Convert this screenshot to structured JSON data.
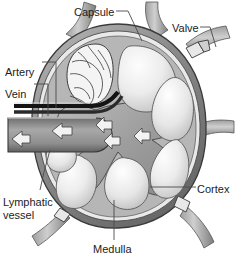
{
  "figure": {
    "style": "grayscale medical illustration",
    "background_color": "#ffffff",
    "palette": {
      "capsule": "#8d8d8d",
      "capsule_dark": "#6a6a6a",
      "cortex_light": "#efefef",
      "cortex_mid": "#cfcfcf",
      "medulla": "#a9a9a9",
      "vein": "#9a9a9a",
      "artery": "#1a1a1a",
      "outline": "#3a3a3a",
      "label_text": "#1c1c1c",
      "leader_line": "#4a4a4a"
    }
  },
  "labels": [
    {
      "id": "capsule",
      "text": "Capsule",
      "text2": "",
      "x": 74,
      "y": 6,
      "anchor": "start"
    },
    {
      "id": "valve",
      "text": "Valve",
      "text2": "",
      "x": 172,
      "y": 22,
      "anchor": "start"
    },
    {
      "id": "artery",
      "text": "Artery",
      "text2": "",
      "x": 5,
      "y": 66,
      "anchor": "start"
    },
    {
      "id": "vein",
      "text": "Vein",
      "text2": "",
      "x": 5,
      "y": 88,
      "anchor": "start"
    },
    {
      "id": "lymphatic-vessel",
      "text": "Lymphatic",
      "text2": "vessel",
      "x": 3,
      "y": 196,
      "anchor": "start"
    },
    {
      "id": "cortex",
      "text": "Cortex",
      "text2": "",
      "x": 197,
      "y": 183,
      "anchor": "start"
    },
    {
      "id": "medulla",
      "text": "Medulla",
      "text2": "",
      "x": 93,
      "y": 243,
      "anchor": "start"
    }
  ],
  "leaders": [
    {
      "id": "capsule-leader",
      "from": [
        116,
        11
      ],
      "to": [
        140,
        41
      ]
    },
    {
      "id": "valve-leader",
      "from": [
        200,
        27
      ],
      "to": [
        215,
        47
      ]
    },
    {
      "id": "artery-leader",
      "from": [
        42,
        62
      ],
      "to": [
        56,
        62
      ],
      "to2": [
        56,
        108
      ]
    },
    {
      "id": "vein-leader",
      "from": [
        34,
        84
      ],
      "to": [
        48,
        84
      ],
      "to2": [
        48,
        117
      ]
    },
    {
      "id": "lymphatic-leader",
      "from": [
        40,
        190
      ],
      "to": [
        48,
        150
      ]
    },
    {
      "id": "cortex-leader",
      "from": [
        195,
        187
      ],
      "to": [
        150,
        187
      ]
    },
    {
      "id": "medulla-leader",
      "from": [
        114,
        240
      ],
      "to": [
        114,
        200
      ]
    }
  ],
  "structures": [
    {
      "id": "capsule-rim",
      "name": "capsule",
      "description": "outer fibrous rim of node"
    },
    {
      "id": "cortex-lobules",
      "name": "cortex",
      "description": "pale lobules ringing the node interior"
    },
    {
      "id": "medulla-sinuses",
      "name": "medulla",
      "description": "branching gray medullary cords at center"
    },
    {
      "id": "vein-trunk",
      "name": "vein",
      "description": "wide gray vessel exiting hilum to the left"
    },
    {
      "id": "artery-trunk",
      "name": "artery",
      "description": "dark thin vessel above the vein"
    },
    {
      "id": "lymph-vessels",
      "name": "lymphatic vessel",
      "description": "vessels entering and leaving the node"
    },
    {
      "id": "valve-flaps",
      "name": "valve",
      "description": "valve leaflets in the efferent vessel"
    },
    {
      "id": "germinal-region",
      "name": "germinal-center",
      "description": "convoluted pale region upper-left interior"
    }
  ],
  "flow_arrows": [
    {
      "id": "arrow-vein-out",
      "direction": "left",
      "x": 62,
      "y": 131
    },
    {
      "id": "arrow-hilum-1",
      "direction": "left",
      "x": 104,
      "y": 127
    },
    {
      "id": "arrow-hilum-2",
      "direction": "left",
      "x": 110,
      "y": 141
    },
    {
      "id": "arrow-vein-exit",
      "direction": "left",
      "x": 22,
      "y": 139
    }
  ]
}
